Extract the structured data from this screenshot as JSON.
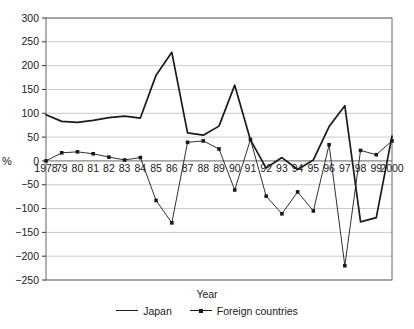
{
  "chart_data": {
    "type": "line",
    "title": "",
    "xlabel": "Year",
    "ylabel": "%",
    "ylim": [
      -250,
      300
    ],
    "ytick_values": [
      300,
      250,
      200,
      150,
      100,
      50,
      0,
      -50,
      -100,
      -150,
      -200,
      -250
    ],
    "ytick_labels": [
      "300",
      "250",
      "200",
      "150",
      "100",
      "50",
      "0",
      "−50",
      "−100",
      "−150",
      "−200",
      "−250"
    ],
    "grid": true,
    "legend_position": "bottom",
    "categories": [
      "1978",
      "79",
      "80",
      "81",
      "82",
      "83",
      "84",
      "85",
      "86",
      "87",
      "88",
      "89",
      "90",
      "91",
      "92",
      "93",
      "94",
      "95",
      "96",
      "97",
      "98",
      "99",
      "2000"
    ],
    "x_values": [
      1978,
      1979,
      1980,
      1981,
      1982,
      1983,
      1984,
      1985,
      1986,
      1987,
      1988,
      1989,
      1990,
      1991,
      1992,
      1993,
      1994,
      1995,
      1996,
      1997,
      1998,
      1999,
      2000
    ],
    "series": [
      {
        "name": "Japan",
        "marker": "none",
        "line_width": 1.7,
        "color": "#1a1a1a",
        "values": [
          97,
          83,
          81,
          85,
          91,
          94,
          90,
          180,
          228,
          59,
          54,
          73,
          159,
          44,
          -15,
          7,
          -18,
          2,
          72,
          116,
          -128,
          -119,
          52
        ]
      },
      {
        "name": "Foreign countries",
        "marker": "square",
        "line_width": 0.9,
        "color": "#1a1a1a",
        "values": [
          0,
          17,
          19,
          15,
          8,
          2,
          7,
          -83,
          -130,
          39,
          42,
          25,
          -61,
          45,
          -74,
          -111,
          -65,
          -105,
          34,
          -220,
          22,
          13,
          42
        ]
      }
    ]
  },
  "legend": {
    "items": [
      {
        "label": "Japan",
        "style": "line"
      },
      {
        "label": "Foreign countries",
        "style": "line-marker"
      }
    ]
  },
  "axis": {
    "x_title": "Year",
    "y_title": "%"
  }
}
